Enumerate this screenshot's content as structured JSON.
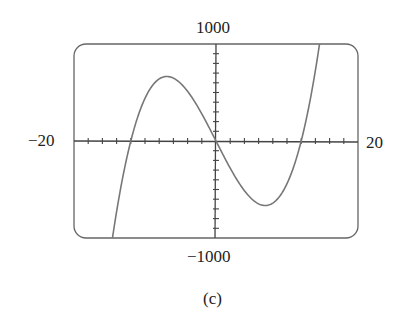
{
  "chart_data": {
    "type": "line",
    "title": "",
    "caption": "(c)",
    "xlabel": "",
    "ylabel": "",
    "xlim": [
      -20,
      20
    ],
    "ylim": [
      -1000,
      1000
    ],
    "x_tick_labels": {
      "min": "−20",
      "max": "20"
    },
    "y_tick_labels": {
      "min": "−1000",
      "max": "1000"
    },
    "x_tick_spacing": 2,
    "y_tick_spacing": 100,
    "grid": false,
    "frame": "rounded-rectangle",
    "series": [
      {
        "name": "f(x)",
        "description": "cubic with zeros near -12, 0, 12; local max ~ (-7, 665), local min ~ (7, -665)",
        "x": [
          -15.2,
          -14,
          -12,
          -10,
          -8,
          -7,
          -6,
          -4,
          -2,
          0,
          2,
          4,
          6,
          7,
          8,
          10,
          12,
          14,
          15.2
        ],
        "y": [
          -1000,
          -728,
          0,
          440,
          640,
          665,
          648,
          512,
          280,
          0,
          -280,
          -512,
          -648,
          -665,
          -640,
          -440,
          0,
          728,
          1000
        ],
        "color": "#777777"
      }
    ]
  },
  "labels": {
    "ymax": "1000",
    "ymin": "−1000",
    "xmin": "−20",
    "xmax": "20",
    "caption": "(c)"
  }
}
